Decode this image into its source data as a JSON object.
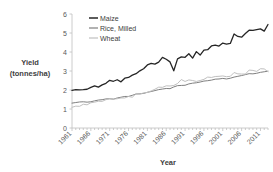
{
  "chart_data": {
    "type": "line",
    "title": "",
    "xlabel": "Year",
    "ylabel": "Yield (tonnes/ha)",
    "ylabel_line1": "Yield",
    "ylabel_line2": "(tonnes/ha)",
    "xlim": [
      1961,
      2013
    ],
    "ylim": [
      0,
      6
    ],
    "yticks": [
      0,
      1,
      2,
      3,
      4,
      5,
      6
    ],
    "ytick_labels": [
      "0",
      "1",
      "2",
      "3",
      "4",
      "5",
      "6"
    ],
    "xticks": [
      1961,
      1966,
      1971,
      1976,
      1981,
      1986,
      1991,
      1996,
      2001,
      2006,
      2011
    ],
    "xtick_labels": [
      "1961",
      "1966",
      "1971",
      "1976",
      "1981",
      "1986",
      "1991",
      "1996",
      "2001",
      "2006",
      "2011"
    ],
    "grid": false,
    "legend_position": "top-left-inside",
    "x": [
      1961,
      1962,
      1963,
      1964,
      1965,
      1966,
      1967,
      1968,
      1969,
      1970,
      1971,
      1972,
      1973,
      1974,
      1975,
      1976,
      1977,
      1978,
      1979,
      1980,
      1981,
      1982,
      1983,
      1984,
      1985,
      1986,
      1987,
      1988,
      1989,
      1990,
      1991,
      1992,
      1993,
      1994,
      1995,
      1996,
      1997,
      1998,
      1999,
      2000,
      2001,
      2002,
      2003,
      2004,
      2005,
      2006,
      2007,
      2008,
      2009,
      2010,
      2011,
      2012,
      2013
    ],
    "series": [
      {
        "name": "Maize",
        "color": "#262626",
        "width": 1.3,
        "values": [
          1.98,
          2.02,
          2.01,
          2.02,
          2.04,
          2.14,
          2.22,
          2.15,
          2.27,
          2.35,
          2.51,
          2.46,
          2.54,
          2.43,
          2.62,
          2.66,
          2.78,
          2.86,
          3.01,
          3.12,
          3.32,
          3.4,
          3.36,
          3.47,
          3.72,
          3.62,
          3.48,
          3.01,
          3.64,
          3.74,
          3.72,
          3.91,
          3.68,
          4.02,
          3.84,
          4.1,
          4.12,
          4.32,
          4.36,
          4.31,
          4.47,
          4.42,
          4.45,
          4.95,
          4.82,
          4.78,
          4.97,
          5.15,
          5.14,
          5.18,
          5.22,
          5.1,
          5.45
        ]
      },
      {
        "name": "Rice, Milled",
        "color": "#7f7f7f",
        "width": 1.0,
        "values": [
          1.31,
          1.34,
          1.37,
          1.38,
          1.36,
          1.38,
          1.43,
          1.47,
          1.49,
          1.53,
          1.54,
          1.52,
          1.58,
          1.62,
          1.66,
          1.66,
          1.72,
          1.79,
          1.8,
          1.82,
          1.88,
          1.92,
          1.97,
          2.02,
          2.05,
          2.08,
          2.07,
          2.16,
          2.23,
          2.24,
          2.25,
          2.32,
          2.36,
          2.38,
          2.42,
          2.47,
          2.49,
          2.52,
          2.57,
          2.58,
          2.61,
          2.58,
          2.62,
          2.68,
          2.72,
          2.76,
          2.81,
          2.86,
          2.85,
          2.88,
          2.93,
          2.96,
          2.99
        ]
      },
      {
        "name": "Wheat",
        "color": "#c0c0c0",
        "width": 1.0,
        "values": [
          1.09,
          1.15,
          1.14,
          1.25,
          1.22,
          1.33,
          1.36,
          1.41,
          1.4,
          1.49,
          1.54,
          1.52,
          1.54,
          1.58,
          1.58,
          1.66,
          1.62,
          1.81,
          1.78,
          1.85,
          1.87,
          1.95,
          2.04,
          2.15,
          2.14,
          2.22,
          2.21,
          2.24,
          2.34,
          2.55,
          2.45,
          2.53,
          2.5,
          2.45,
          2.5,
          2.56,
          2.68,
          2.66,
          2.71,
          2.72,
          2.74,
          2.7,
          2.72,
          2.92,
          2.85,
          2.84,
          2.84,
          3.05,
          3.03,
          2.98,
          3.12,
          3.11,
          2.96
        ]
      }
    ]
  }
}
